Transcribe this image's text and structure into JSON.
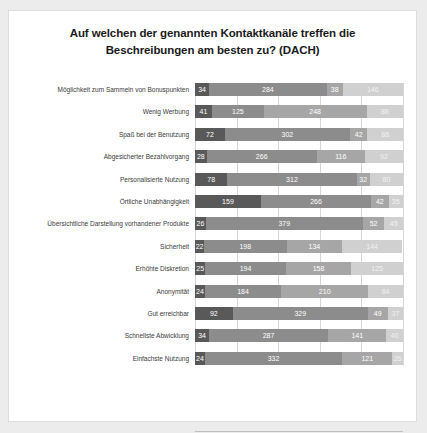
{
  "chart_data": {
    "type": "bar",
    "orientation": "horizontal",
    "stacked": true,
    "title": "Auf welchen der genannten Kontaktkanäle treffen die Beschreibungen am besten zu? (DACH)",
    "title_line1": "Auf welchen der genannten Kontaktkanäle treffen die",
    "title_line2": "Beschreibungen am besten zu? (DACH)",
    "xlabel": "Teilnehmer",
    "ylabel": "",
    "xlim": [
      0,
      500
    ],
    "xticks": [
      0,
      100,
      200,
      300,
      400,
      500
    ],
    "grid": true,
    "legend_position": "bottom",
    "categories": [
      "Möglichkeit zum Sammeln von Bonuspunkten",
      "Wenig Werbung",
      "Spaß bei der Benutzung",
      "Abgesicherter Bezahlvorgang",
      "Personalisierte Nutzung",
      "Örtliche Unabhängigkeit",
      "Übersichtliche Darstellung vorhandener Produkte",
      "Sicherheit",
      "Erhöhte Diskretion",
      "Anonymität",
      "Gut erreichbar",
      "Schnellste Abwicklung",
      "Einfachste Nutzung"
    ],
    "series": [
      {
        "name": "Smartphone/Tablet",
        "color": "#595959",
        "values": [
          34,
          41,
          72,
          28,
          78,
          159,
          26,
          22,
          25,
          24,
          92,
          34,
          24
        ]
      },
      {
        "name": "PC/Laptop",
        "color": "#8c8c8c",
        "values": [
          284,
          125,
          302,
          266,
          312,
          266,
          379,
          198,
          194,
          184,
          329,
          287,
          332
        ]
      },
      {
        "name": "Automat",
        "color": "#a6a6a6",
        "values": [
          38,
          248,
          42,
          116,
          32,
          42,
          52,
          134,
          158,
          210,
          49,
          141,
          121
        ]
      },
      {
        "name": "keine Angabe",
        "color": "#d0d0d0",
        "values": [
          146,
          88,
          86,
          92,
          80,
          35,
          45,
          144,
          125,
          84,
          37,
          40,
          26
        ]
      }
    ]
  }
}
